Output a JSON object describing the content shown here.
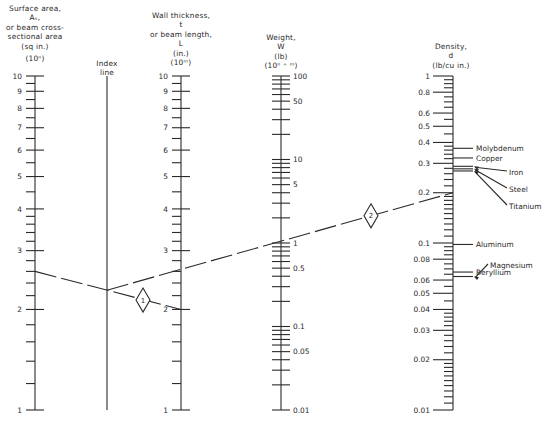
{
  "headers": {
    "surface_area": [
      "Surface area,",
      "Aₛ,",
      "or beam cross-",
      "sectional area",
      "(sq in.)",
      "(10ⁿ)"
    ],
    "index_line": [
      "Index",
      "line"
    ],
    "wall_thickness": [
      "Wall thickness,",
      "t",
      "or beam length,",
      "L",
      "(in.)",
      "(10ᵐ)"
    ],
    "weight": [
      "Weight,",
      "W",
      "(lb)",
      "(10ⁿ ⁺ ᵐ)"
    ],
    "density": [
      "Density,",
      "d",
      "(lb/cu in.)"
    ]
  },
  "chart_data": {
    "type": "nomogram",
    "title": "",
    "axes": [
      {
        "name": "Surface area A_s or beam cross-sectional area",
        "unit": "sq in. (10^n)",
        "scale": "log",
        "range": [
          1,
          10
        ],
        "labels": [
          "1",
          "2",
          "3",
          "4",
          "5",
          "6",
          "7",
          "8",
          "9",
          "10"
        ]
      },
      {
        "name": "Index line",
        "unit": "",
        "scale": "none",
        "labels": []
      },
      {
        "name": "Wall thickness t or beam length L",
        "unit": "in. (10^m)",
        "scale": "log",
        "range": [
          1,
          10
        ],
        "labels": [
          "1",
          "2",
          "3",
          "4",
          "5",
          "6",
          "7",
          "8",
          "9",
          "10"
        ]
      },
      {
        "name": "Weight W",
        "unit": "lb (10^(n+m))",
        "scale": "log",
        "range": [
          0.01,
          100
        ],
        "labels": [
          "0.01",
          "0.05",
          "0.1",
          "0.5",
          "1",
          "5",
          "10",
          "50",
          "100"
        ]
      },
      {
        "name": "Density d",
        "unit": "lb/cu in.",
        "scale": "log",
        "range": [
          0.01,
          1
        ],
        "labels": [
          "0.01",
          "0.02",
          "0.03",
          "0.04",
          "0.05",
          "0.06",
          "0.08",
          "0.1",
          "0.2",
          "0.3",
          "0.4",
          "0.5",
          "0.6",
          "0.8",
          "1"
        ]
      }
    ],
    "materials": [
      {
        "name": "Molybdenum",
        "density": 0.369
      },
      {
        "name": "Copper",
        "density": 0.323
      },
      {
        "name": "Iron",
        "density": 0.284
      },
      {
        "name": "Steel",
        "density": 0.283
      },
      {
        "name": "Titanium",
        "density": 0.163
      },
      {
        "name": "Aluminum",
        "density": 0.098
      },
      {
        "name": "Beryllium",
        "density": 0.067
      },
      {
        "name": "Magnesium",
        "density": 0.063
      }
    ],
    "example_lines": [
      {
        "step": "1",
        "from": {
          "axis": "Surface area",
          "value": 2.6
        },
        "through": {
          "axis": "Index line"
        },
        "to": {
          "axis": "Wall thickness",
          "value": 2.0
        }
      },
      {
        "step": "2",
        "from": {
          "axis": "Index line"
        },
        "through": {
          "axis": "Wall thickness",
          "value": 2.6
        },
        "via": {
          "axis": "Weight",
          "value": 1.0
        },
        "to": {
          "axis": "Density",
          "value": 0.2
        }
      }
    ],
    "step_markers": [
      "1",
      "2"
    ]
  }
}
